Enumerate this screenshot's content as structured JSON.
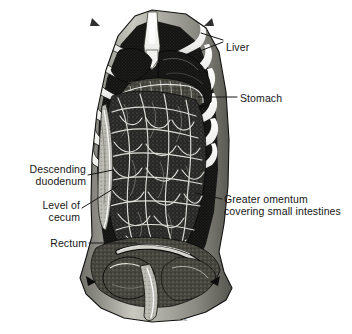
{
  "figure": {
    "background_color": "#ffffff",
    "ink_color": "#161616",
    "bone_color": "#f4f4f2",
    "width": 352,
    "height": 334,
    "style": "black-and-white medical engraving / stipple halftone"
  },
  "labels": {
    "liver": {
      "text": "Liver",
      "x": 226,
      "y": 41,
      "align": "left"
    },
    "stomach": {
      "text": "Stomach",
      "x": 240,
      "y": 92,
      "align": "left"
    },
    "descending_duodenum_line1": {
      "text": "Descending",
      "x": 14,
      "y": 163,
      "align": "right"
    },
    "descending_duodenum_line2": {
      "text": "duodenum",
      "x": 14,
      "y": 175,
      "align": "right"
    },
    "level_of_cecum_line1": {
      "text": "Level of",
      "x": 29,
      "y": 199,
      "align": "right"
    },
    "level_of_cecum_line2": {
      "text": "cecum",
      "x": 29,
      "y": 211,
      "align": "right"
    },
    "rectum": {
      "text": "Rectum",
      "x": 44,
      "y": 240,
      "align": "right"
    },
    "greater_omentum_line1": {
      "text": "Greater omentum",
      "x": 224,
      "y": 193,
      "align": "left"
    },
    "greater_omentum_line2": {
      "text": "covering small intestines",
      "x": 224,
      "y": 205,
      "align": "left"
    }
  },
  "credit": {
    "text": "ill.nL",
    "x": 180,
    "y": 318
  },
  "structures": [
    {
      "name": "sternum",
      "description": "central white sternal bone with xiphoid process at top midline"
    },
    {
      "name": "rib-cage",
      "description": "white costal arches flaring left and right from the sternum"
    },
    {
      "name": "liver",
      "description": "dark lobed organ beneath the right costal margin"
    },
    {
      "name": "stomach",
      "description": "greater curvature visible below the left costal margin"
    },
    {
      "name": "greater-omentum",
      "description": "fatty apron with dense white vascular network covering the small intestines"
    },
    {
      "name": "descending-duodenum",
      "description": "vertical pale tube along the right abdominal gutter"
    },
    {
      "name": "cecum",
      "description": "lower right quadrant level marker"
    },
    {
      "name": "rectum",
      "description": "terminal bowel segment in the pelvis"
    },
    {
      "name": "abdominal-wall-flap",
      "description": "reflected pale body wall forming the lateral borders"
    },
    {
      "name": "pelvic-brim",
      "description": "lower pelvic organs and iliac crests at the base"
    }
  ],
  "leader_lines": {
    "liver_upper": {
      "from_x": 223,
      "from_y": 40,
      "to_x": 201,
      "to_y": 33
    },
    "liver_lower": {
      "from_x": 223,
      "from_y": 42,
      "to_x": 200,
      "to_y": 51
    },
    "stomach": {
      "from_x": 237,
      "from_y": 97,
      "to_x": 198,
      "to_y": 97
    },
    "descending_duodenum": {
      "from_x": 88,
      "from_y": 175,
      "to_x": 113,
      "to_y": 170
    },
    "level_of_cecum": {
      "from_x": 82,
      "from_y": 208,
      "to_x": 118,
      "to_y": 186
    },
    "rectum": {
      "from_x": 89,
      "from_y": 243,
      "to_x": 137,
      "to_y": 243
    },
    "greater_omentum": {
      "from_x": 222,
      "from_y": 199,
      "to_x": 196,
      "to_y": 193
    }
  }
}
